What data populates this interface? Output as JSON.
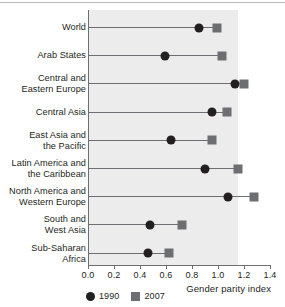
{
  "chart_data": {
    "type": "scatter",
    "title": "",
    "xlabel": "Gender parity index",
    "ylabel": "",
    "xlim": [
      0.0,
      1.4
    ],
    "xticks": [
      "0.0",
      "0.2",
      "0.4",
      "0.6",
      "0.8",
      "1.0",
      "1.2",
      "1.4"
    ],
    "grid": false,
    "legend_position": "bottom-left",
    "categories": [
      "World",
      "Arab States",
      "Central and\nEastern Europe",
      "Central Asia",
      "East Asia and\nthe Pacific",
      "Latin America and\nthe Caribbean",
      "North America and\nWestern Europe",
      "South and\nWest Asia",
      "Sub-Saharan\nAfrica"
    ],
    "series": [
      {
        "name": "1990",
        "marker": "circle",
        "color": "#231f20",
        "values": [
          0.85,
          0.59,
          1.13,
          0.95,
          0.64,
          0.9,
          1.08,
          0.48,
          0.46
        ]
      },
      {
        "name": "2007",
        "marker": "square",
        "color": "#6d6e71",
        "values": [
          0.99,
          1.03,
          1.2,
          1.07,
          0.95,
          1.15,
          1.28,
          0.72,
          0.62
        ]
      }
    ]
  },
  "legend": {
    "items": [
      {
        "label": "1990",
        "marker": "circle"
      },
      {
        "label": "2007",
        "marker": "square"
      }
    ]
  },
  "axis": {
    "x_title": "Gender parity index"
  }
}
